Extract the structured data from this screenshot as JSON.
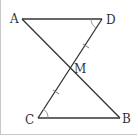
{
  "diagram": {
    "type": "geometry",
    "points": {
      "A": {
        "label": "A",
        "x": 22,
        "y": 19
      },
      "D": {
        "label": "D",
        "x": 102,
        "y": 19
      },
      "M": {
        "label": "M",
        "x": 70,
        "y": 69
      },
      "C": {
        "label": "C",
        "x": 38,
        "y": 118
      },
      "B": {
        "label": "B",
        "x": 120,
        "y": 118
      }
    },
    "segments": [
      "AD",
      "AB",
      "DC",
      "CB"
    ],
    "marks": {
      "equal_ticks": [
        "DM",
        "MC"
      ],
      "equal_angles": [
        "ADM",
        "BCM"
      ]
    },
    "colors": {
      "line": "#333333",
      "angle_arc": "#888888",
      "frame": "#c8c8c8"
    }
  }
}
